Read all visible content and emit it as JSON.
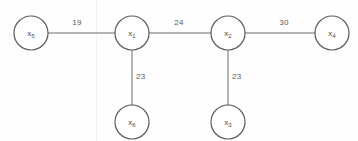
{
  "figure": {
    "background_color": "#fefefe",
    "stroke_color": "#6d6d6d",
    "text_color": "#4a4a4a"
  },
  "graph": {
    "type": "undirected-weighted-graph",
    "nodes": [
      {
        "id": "x5",
        "var": "x",
        "sub": "5",
        "cx": 31,
        "cy": 33,
        "r": 17
      },
      {
        "id": "x1",
        "var": "x",
        "sub": "1",
        "cx": 132,
        "cy": 33,
        "r": 17
      },
      {
        "id": "x2",
        "var": "x",
        "sub": "2",
        "cx": 228,
        "cy": 33,
        "r": 17
      },
      {
        "id": "x4",
        "var": "x",
        "sub": "4",
        "cx": 332,
        "cy": 33,
        "r": 17
      },
      {
        "id": "x6",
        "var": "x",
        "sub": "6",
        "cx": 132,
        "cy": 122,
        "r": 17
      },
      {
        "id": "x3",
        "var": "x",
        "sub": "3",
        "cx": 228,
        "cy": 122,
        "r": 17
      }
    ],
    "edges": [
      {
        "from": "x5",
        "to": "x1",
        "weight": "19",
        "x1": 48,
        "y1": 33,
        "x2": 115,
        "y2": 33,
        "label_x": 77,
        "label_y": 25,
        "orient": "horiz"
      },
      {
        "from": "x1",
        "to": "x2",
        "weight": "24",
        "x1": 149,
        "y1": 33,
        "x2": 211,
        "y2": 33,
        "label_x": 179,
        "label_y": 25,
        "orient": "horiz"
      },
      {
        "from": "x2",
        "to": "x4",
        "weight": "30",
        "x1": 245,
        "y1": 33,
        "x2": 315,
        "y2": 33,
        "label_x": 284,
        "label_y": 25,
        "orient": "horiz"
      },
      {
        "from": "x1",
        "to": "x6",
        "weight": "23",
        "x1": 132,
        "y1": 50,
        "x2": 132,
        "y2": 105,
        "label_x": 136,
        "label_y": 79,
        "orient": "vert"
      },
      {
        "from": "x2",
        "to": "x3",
        "weight": "23",
        "x1": 228,
        "y1": 50,
        "x2": 228,
        "y2": 105,
        "label_x": 232,
        "label_y": 79,
        "orient": "vert"
      }
    ],
    "artifacts": [
      {
        "name": "scan-line",
        "x": 96,
        "color": "#f1f1f1"
      }
    ]
  }
}
